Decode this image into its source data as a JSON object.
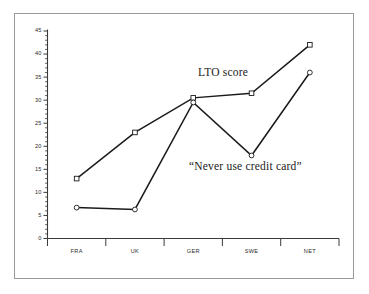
{
  "figure": {
    "background_color": "#ffffff",
    "frame_color": "#9a9a9a",
    "axis_color": "#3a3a3a",
    "line_color": "#1a1a1a"
  },
  "annotations": {
    "lto_label": "LTO score",
    "credit_label": "“Never use credit card”"
  },
  "chart_data": {
    "type": "line",
    "title": "",
    "subtitle": "",
    "xlabel": "",
    "ylabel": "",
    "categories": [
      "FRA",
      "UK",
      "GER",
      "SWE",
      "NET"
    ],
    "ylim": [
      0,
      45
    ],
    "yticks": [
      0,
      5,
      10,
      15,
      20,
      25,
      30,
      35,
      40,
      45
    ],
    "ytick_labels": [
      "0",
      "5",
      "10",
      "15",
      "20",
      "25",
      "30",
      "35",
      "40",
      "45"
    ],
    "minor_tick_step": 1,
    "grid": false,
    "legend_position": "inline-annotation",
    "series": [
      {
        "name": "LTO score",
        "marker": "square",
        "values": [
          13,
          23,
          30.5,
          31.5,
          42
        ]
      },
      {
        "name": "“Never use credit card”",
        "marker": "circle",
        "values": [
          6.7,
          6.3,
          29.5,
          18,
          36
        ]
      }
    ]
  }
}
